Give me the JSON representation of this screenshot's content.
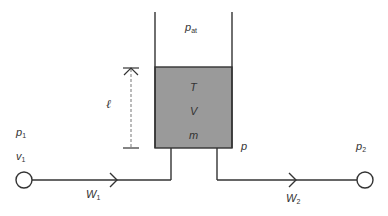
{
  "diagram": {
    "type": "tank-flow-schematic",
    "colors": {
      "line": "#333333",
      "fluid_fill": "#9a9a9a",
      "background": "#ffffff"
    },
    "labels": {
      "atmospheric_pressure": {
        "base": "p",
        "sub": "at"
      },
      "temperature": "T",
      "volume": "V",
      "mass": "m",
      "level": "ℓ",
      "tank_pressure": "p",
      "inlet_pressure": {
        "base": "p",
        "sub": "1"
      },
      "inlet_velocity": {
        "base": "v",
        "sub": "1"
      },
      "outlet_pressure": {
        "base": "p",
        "sub": "2"
      },
      "inlet_flow": {
        "base": "W",
        "sub": "1"
      },
      "outlet_flow": {
        "base": "W",
        "sub": "2"
      }
    },
    "nodes": [
      {
        "id": "inlet-node",
        "cx": 24,
        "cy": 180,
        "r": 8
      },
      {
        "id": "outlet-node",
        "cx": 365,
        "cy": 180,
        "r": 8
      }
    ],
    "flows": [
      {
        "id": "inlet-arrow",
        "direction": "right"
      },
      {
        "id": "outlet-arrow",
        "direction": "right"
      }
    ]
  }
}
